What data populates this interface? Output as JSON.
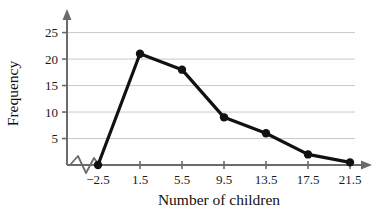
{
  "chart_data": {
    "type": "line",
    "title": "",
    "subtitle": "",
    "xlabel": "Number of children",
    "ylabel": "Frequency",
    "x": [
      -2.5,
      1.5,
      5.5,
      9.5,
      13.5,
      17.5,
      21.5
    ],
    "xtick_labels": [
      "−2.5",
      "1.5",
      "5.5",
      "9.5",
      "13.5",
      "17.5",
      "21.5"
    ],
    "values": [
      0,
      21,
      18,
      9,
      6,
      2,
      0.5
    ],
    "ytick_labels": [
      "5",
      "10",
      "15",
      "20",
      "25"
    ],
    "yticks": [
      5,
      10,
      15,
      20,
      25
    ],
    "ylim": [
      0,
      27
    ],
    "xlim": [
      -2.5,
      21.5
    ],
    "grid": "horizontal",
    "legend": "none",
    "markers": "filled-circle",
    "series": [
      {
        "name": "Frequency",
        "values": [
          0,
          21,
          18,
          9,
          6,
          2,
          0.5
        ]
      }
    ],
    "annotations": [
      "axis-break-zigzag-on-x-axis-near-origin"
    ],
    "colors": {
      "line": "#111111",
      "marker": "#111111",
      "grid": "#c9c9c9",
      "axis": "#6b6b6b",
      "background": "#ffffff",
      "text": "#1a1a1a"
    }
  }
}
